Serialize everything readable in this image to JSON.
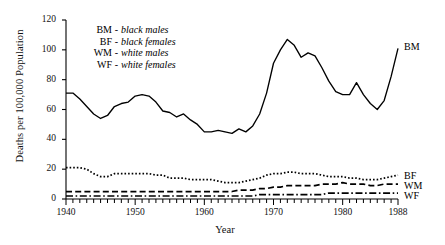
{
  "chart_data": {
    "type": "line",
    "title": "",
    "xlabel": "Year",
    "ylabel": "Deaths per 100,000 Population",
    "xlim": [
      1940,
      1988
    ],
    "ylim": [
      0,
      120
    ],
    "yticks": [
      0,
      20,
      40,
      60,
      80,
      100,
      120
    ],
    "xticks": [
      1940,
      1950,
      1960,
      1970,
      1980,
      1988
    ],
    "xtick_labels": [
      "1940",
      "1950",
      "1960",
      "1970",
      "1980",
      "1988"
    ],
    "ytick_labels": [
      "0",
      "20",
      "40",
      "60",
      "80",
      "100",
      "120"
    ],
    "minor_xticks_every": 1,
    "grid": false,
    "legend_position": "upper-left-inside",
    "x": [
      1940,
      1941,
      1942,
      1943,
      1944,
      1945,
      1946,
      1947,
      1948,
      1949,
      1950,
      1951,
      1952,
      1953,
      1954,
      1955,
      1956,
      1957,
      1958,
      1959,
      1960,
      1961,
      1962,
      1963,
      1964,
      1965,
      1966,
      1967,
      1968,
      1969,
      1970,
      1971,
      1972,
      1973,
      1974,
      1975,
      1976,
      1977,
      1978,
      1979,
      1980,
      1981,
      1982,
      1983,
      1984,
      1985,
      1986,
      1987,
      1988
    ],
    "series": [
      {
        "name": "BM",
        "label": "BM",
        "description": "black males",
        "style": "solid",
        "values": [
          71,
          71,
          67,
          62,
          57,
          54,
          56,
          62,
          64,
          65,
          69,
          70,
          69,
          65,
          59,
          58,
          55,
          57,
          53,
          50,
          45,
          45,
          46,
          45,
          44,
          47,
          45,
          49,
          57,
          71,
          91,
          100,
          107,
          103,
          95,
          98,
          96,
          88,
          79,
          72,
          70,
          70,
          78,
          70,
          64,
          60,
          66,
          82,
          101
        ]
      },
      {
        "name": "BF",
        "label": "BF",
        "description": "black females",
        "style": "dotted",
        "values": [
          21,
          21,
          21,
          20,
          17,
          15,
          15,
          17,
          17,
          17,
          17,
          17,
          17,
          16,
          16,
          14,
          14,
          14,
          13,
          13,
          13,
          13,
          12,
          11,
          11,
          11,
          12,
          13,
          14,
          16,
          17,
          17,
          18,
          18,
          17,
          17,
          17,
          16,
          15,
          15,
          15,
          14,
          14,
          13,
          13,
          13,
          14,
          15,
          16
        ]
      },
      {
        "name": "WM",
        "label": "WM",
        "description": "white males",
        "style": "dashed",
        "values": [
          5,
          5,
          5,
          5,
          5,
          5,
          5,
          5,
          5,
          5,
          5,
          5,
          5,
          5,
          5,
          5,
          5,
          5,
          5,
          5,
          5,
          5,
          5,
          5,
          5,
          6,
          6,
          6,
          7,
          7,
          8,
          8,
          9,
          9,
          9,
          9,
          9,
          10,
          10,
          10,
          11,
          10,
          10,
          10,
          9,
          9,
          10,
          10,
          10
        ]
      },
      {
        "name": "WF",
        "label": "WF",
        "description": "white females",
        "style": "dash-dot",
        "values": [
          2,
          2,
          2,
          2,
          2,
          2,
          2,
          2,
          2,
          2,
          2,
          2,
          2,
          2,
          2,
          2,
          2,
          2,
          2,
          2,
          2,
          2,
          2,
          2,
          2,
          2,
          2,
          2,
          3,
          3,
          3,
          3,
          3,
          3,
          3,
          3,
          3,
          3,
          4,
          4,
          4,
          4,
          4,
          4,
          4,
          4,
          4,
          4,
          4
        ]
      }
    ]
  },
  "legend": {
    "rows": [
      {
        "code": "BM",
        "dash": "-",
        "name": "black males"
      },
      {
        "code": "BF",
        "dash": "-",
        "name": "black females"
      },
      {
        "code": "WM",
        "dash": "-",
        "name": "white males"
      },
      {
        "code": "WF",
        "dash": "-",
        "name": "white females"
      }
    ]
  },
  "series_end_labels": [
    {
      "text": "BM"
    },
    {
      "text": "BF"
    },
    {
      "text": "WM"
    },
    {
      "text": "WF"
    }
  ],
  "colors": {
    "line": "#000000",
    "axis": "#000000",
    "background": "#ffffff",
    "text": "#111111"
  }
}
